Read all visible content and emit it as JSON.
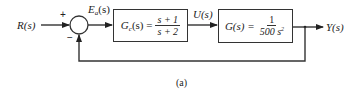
{
  "diagram": {
    "type": "feedback-control-block-diagram",
    "caption": "(a)",
    "input": {
      "label": "R(s)"
    },
    "summing_junction": {
      "plus_sign": "+",
      "minus_sign": "−"
    },
    "error_signal": {
      "label_main": "E",
      "label_sub": "a",
      "label_tail": "(s)"
    },
    "controller_block": {
      "lhs_main": "G",
      "lhs_sub": "c",
      "lhs_tail": "(s) =",
      "numerator": "s + 1",
      "denominator": "s + 2"
    },
    "control_signal": {
      "label": "U(s)"
    },
    "plant_block": {
      "lhs": "G(s) =",
      "numerator": "1",
      "denominator_coeff": "500 s",
      "denominator_exp": "2"
    },
    "output": {
      "label": "Y(s)"
    },
    "feedback": {
      "type": "unity negative feedback"
    },
    "colors": {
      "line": "#333333",
      "background": "#ffffff"
    }
  }
}
